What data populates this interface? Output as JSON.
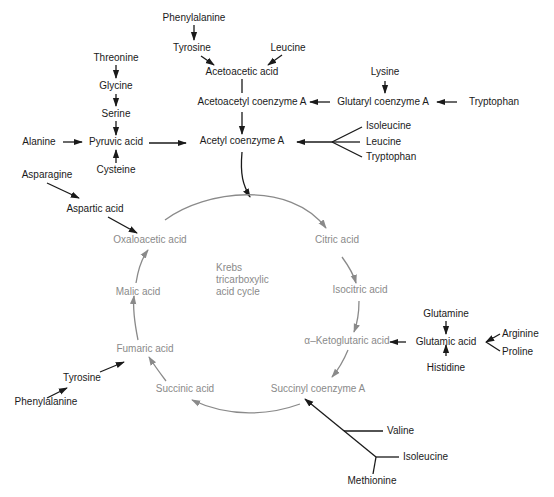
{
  "diagram": {
    "title": "Krebs tricarboxylic acid cycle",
    "center_label": [
      "Krebs",
      "tricarboxylic",
      "acid cycle"
    ],
    "colors": {
      "feeder": "#1a1a1a",
      "cycle": "#8a8a8a",
      "background": "#ffffff"
    },
    "cycle_intermediates": [
      "Citric acid",
      "Isocitric acid",
      "α–Ketoglutaric acid",
      "Succinyl coenzyme A",
      "Succinic acid",
      "Fumaric acid",
      "Malic acid",
      "Oxaloacetic acid"
    ],
    "nodes": {
      "phenylalanine_top": "Phenylalanine",
      "tyrosine_top": "Tyrosine",
      "leucine_top": "Leucine",
      "acetoacetic_acid": "Acetoacetic acid",
      "lysine": "Lysine",
      "acetoacetyl_coa": "Acetoacetyl coenzyme A",
      "glutaryl_coa": "Glutaryl coenzyme A",
      "tryptophan_glutaryl": "Tryptophan",
      "threonine": "Threonine",
      "glycine": "Glycine",
      "serine": "Serine",
      "alanine": "Alanine",
      "pyruvic_acid": "Pyruvic acid",
      "cysteine": "Cysteine",
      "acetyl_coa": "Acetyl coenzyme A",
      "isoleucine_acetyl": "Isoleucine",
      "leucine_acetyl": "Leucine",
      "tryptophan_acetyl": "Tryptophan",
      "asparagine": "Asparagine",
      "aspartic_acid": "Aspartic acid",
      "oxaloacetic_acid": "Oxaloacetic acid",
      "citric_acid": "Citric acid",
      "isocitric_acid": "Isocitric acid",
      "malic_acid": "Malic acid",
      "ketoglutaric_acid": "α–Ketoglutaric acid",
      "glutamine": "Glutamine",
      "glutamic_acid": "Glutamic acid",
      "arginine": "Arginine",
      "proline": "Proline",
      "histidine": "Histidine",
      "fumaric_acid": "Fumaric acid",
      "tyrosine_bottom": "Tyrosine",
      "phenylalanine_bottom": "Phenylalanine",
      "succinic_acid": "Succinic acid",
      "succinyl_coa": "Succinyl coenzyme A",
      "valine": "Valine",
      "isoleucine_bottom": "Isoleucine",
      "methionine": "Methionine"
    },
    "edges": [
      [
        "Phenylalanine",
        "Tyrosine"
      ],
      [
        "Tyrosine",
        "Acetoacetic acid"
      ],
      [
        "Leucine",
        "Acetoacetic acid"
      ],
      [
        "Acetoacetic acid",
        "Acetoacetyl coenzyme A"
      ],
      [
        "Acetoacetyl coenzyme A",
        "Acetyl coenzyme A"
      ],
      [
        "Lysine",
        "Glutaryl coenzyme A"
      ],
      [
        "Tryptophan",
        "Glutaryl coenzyme A"
      ],
      [
        "Glutaryl coenzyme A",
        "Acetoacetyl coenzyme A"
      ],
      [
        "Threonine",
        "Glycine"
      ],
      [
        "Glycine",
        "Serine"
      ],
      [
        "Serine",
        "Pyruvic acid"
      ],
      [
        "Alanine",
        "Pyruvic acid"
      ],
      [
        "Cysteine",
        "Pyruvic acid"
      ],
      [
        "Pyruvic acid",
        "Acetyl coenzyme A"
      ],
      [
        "Isoleucine / Leucine / Tryptophan",
        "Acetyl coenzyme A"
      ],
      [
        "Acetyl coenzyme A",
        "Citric acid"
      ],
      [
        "Asparagine",
        "Aspartic acid"
      ],
      [
        "Aspartic acid",
        "Oxaloacetic acid"
      ],
      [
        "Glutamine",
        "Glutamic acid"
      ],
      [
        "Histidine",
        "Glutamic acid"
      ],
      [
        "Arginine / Proline",
        "Glutamic acid"
      ],
      [
        "Glutamic acid",
        "α–Ketoglutaric acid"
      ],
      [
        "Phenylalanine",
        "Tyrosine"
      ],
      [
        "Tyrosine",
        "Fumaric acid"
      ],
      [
        "Valine / Isoleucine / Methionine",
        "Succinyl coenzyme A"
      ]
    ]
  }
}
